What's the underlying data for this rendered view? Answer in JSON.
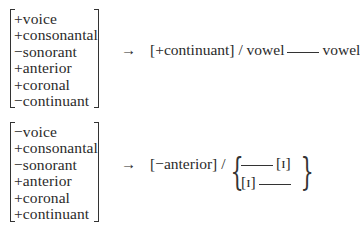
{
  "rules": [
    {
      "features": [
        {
          "sign": "+",
          "name": "voice",
          "text": "+voice"
        },
        {
          "sign": "+",
          "name": "consonantal",
          "text": "+consonantal"
        },
        {
          "sign": "−",
          "name": "sonorant",
          "text": "−sonorant"
        },
        {
          "sign": "+",
          "name": "anterior",
          "text": "+anterior"
        },
        {
          "sign": "+",
          "name": "coronal",
          "text": "+coronal"
        },
        {
          "sign": "−",
          "name": "continuant",
          "text": "−continuant"
        }
      ],
      "arrow": "→",
      "change": "[+continuant]",
      "slash": "/",
      "environment": {
        "left": "vowel",
        "right": "vowel"
      }
    },
    {
      "features": [
        {
          "sign": "−",
          "name": "voice",
          "text": "−voice"
        },
        {
          "sign": "+",
          "name": "consonantal",
          "text": "+consonantal"
        },
        {
          "sign": "−",
          "name": "sonorant",
          "text": "−sonorant"
        },
        {
          "sign": "+",
          "name": "anterior",
          "text": "+anterior"
        },
        {
          "sign": "+",
          "name": "coronal",
          "text": "+coronal"
        },
        {
          "sign": "+",
          "name": "continuant",
          "text": "+continuant"
        }
      ],
      "arrow": "→",
      "change": "[−anterior]",
      "slash": "/",
      "environment": {
        "brace_open": "{",
        "brace_close": "}",
        "options": [
          {
            "after_blank": "[ɪ]"
          },
          {
            "before_blank": "[ɪ]"
          }
        ]
      }
    }
  ]
}
